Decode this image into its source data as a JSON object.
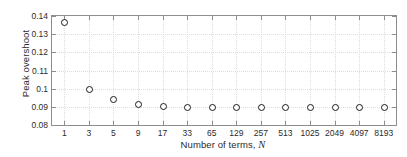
{
  "chart_data": {
    "type": "scatter",
    "title": "",
    "xlabel": "Number of terms, N",
    "ylabel": "Peak overshoot",
    "categories": [
      "1",
      "3",
      "5",
      "9",
      "17",
      "33",
      "65",
      "129",
      "257",
      "513",
      "1025",
      "2049",
      "4097",
      "8193"
    ],
    "values": [
      0.1365,
      0.1,
      0.0942,
      0.0915,
      0.0903,
      0.09,
      0.09,
      0.09,
      0.09,
      0.09,
      0.09,
      0.09,
      0.09,
      0.09
    ],
    "ylim": [
      0.08,
      0.14
    ],
    "yticks": [
      "0.08",
      "0.09",
      "0.1",
      "0.11",
      "0.12",
      "0.13",
      "0.14"
    ],
    "ytick_values": [
      0.08,
      0.09,
      0.1,
      0.11,
      0.12,
      0.13,
      0.14
    ],
    "grid": true,
    "legend": null,
    "marker_style": "open-circle",
    "marker_color": "#1a1a1a",
    "axis_color": "#8d8d8d",
    "grid_color": "#dcdcdc",
    "text_color": "#2b2b2b",
    "background_color": "#ffffff"
  }
}
